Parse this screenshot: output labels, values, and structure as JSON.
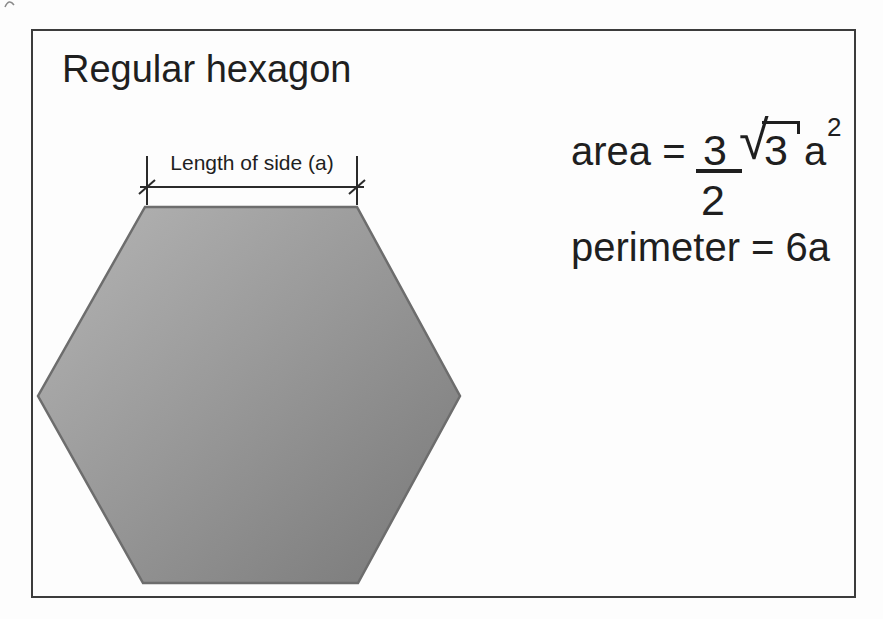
{
  "title": "Regular hexagon",
  "diagram": {
    "side_label": "Length of side (a)"
  },
  "formulas": {
    "area": {
      "lhs": "area =",
      "numerator": "3",
      "denominator": "2",
      "radical_sign": "√",
      "radicand": "3",
      "variable": "a",
      "exponent": "2"
    },
    "perimeter": "perimeter = 6a"
  },
  "colors": {
    "background": "#fdfdfd",
    "frame_border": "#3c3c3c",
    "text": "#1f1f1f",
    "hex_fill_light": "#b5b5b5",
    "hex_fill_mid": "#989898",
    "hex_fill_dark": "#787878",
    "hex_stroke": "#6d6d6d",
    "dimension_line": "#2b2b2b"
  }
}
